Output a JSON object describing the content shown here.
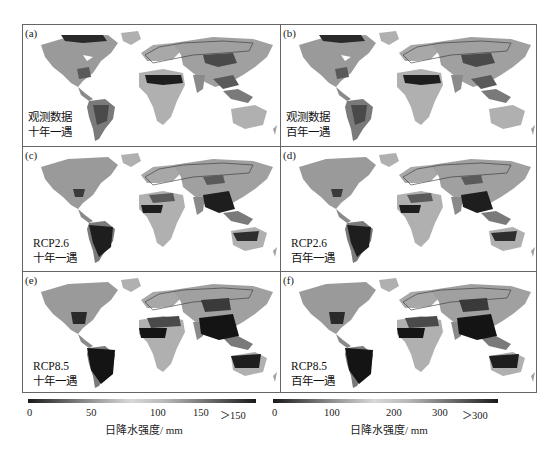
{
  "figure": {
    "panels": [
      {
        "id": "a",
        "label": "(a)",
        "line1": "观测数据",
        "line2": "十年一遇",
        "variant": "obs"
      },
      {
        "id": "b",
        "label": "(b)",
        "line1": "观测数据",
        "line2": "百年一遇",
        "variant": "obs"
      },
      {
        "id": "c",
        "label": "(c)",
        "line1": "RCP2.6",
        "line2": "十年一遇",
        "variant": "rcp26"
      },
      {
        "id": "d",
        "label": "(d)",
        "line1": "RCP2.6",
        "line2": "百年一遇",
        "variant": "rcp26"
      },
      {
        "id": "e",
        "label": "(e)",
        "line1": "RCP8.5",
        "line2": "十年一遇",
        "variant": "rcp85"
      },
      {
        "id": "f",
        "label": "(f)",
        "line1": "RCP8.5",
        "line2": "百年一遇",
        "variant": "rcp85"
      }
    ],
    "colorbars": [
      {
        "ticks": [
          "0",
          "50",
          "100",
          "150",
          "＞150"
        ],
        "unit": "日降水强度/ mm",
        "applies_to": "十年一遇"
      },
      {
        "ticks": [
          "0",
          "100",
          "200",
          "300",
          "＞300"
        ],
        "unit": "日降水强度/ mm",
        "applies_to": "百年一遇"
      }
    ],
    "colors": {
      "dark": "#1a1a1a",
      "mid": "#8a8a8a",
      "light": "#c8c8c8",
      "frame": "#666666"
    }
  }
}
